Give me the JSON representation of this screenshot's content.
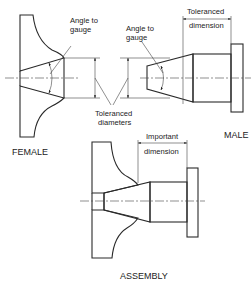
{
  "diagram": {
    "type": "engineering-drawing",
    "views": [
      {
        "id": "female",
        "label": "FEMALE"
      },
      {
        "id": "male",
        "label": "MALE"
      },
      {
        "id": "assembly",
        "label": "ASSEMBLY"
      }
    ],
    "annotations": {
      "female_angle": [
        "Angle to",
        "gauge"
      ],
      "male_angle": [
        "Angle to",
        "gauge"
      ],
      "toleranced_diameters": [
        "Toleranced",
        "diameters"
      ],
      "toleranced_dimension": [
        "Toleranced",
        "dimension"
      ],
      "important_dimension": [
        "Important",
        "dimension"
      ]
    },
    "colors": {
      "line": "#2a2a2a",
      "hatch": "#555555",
      "background": "#ffffff"
    }
  }
}
